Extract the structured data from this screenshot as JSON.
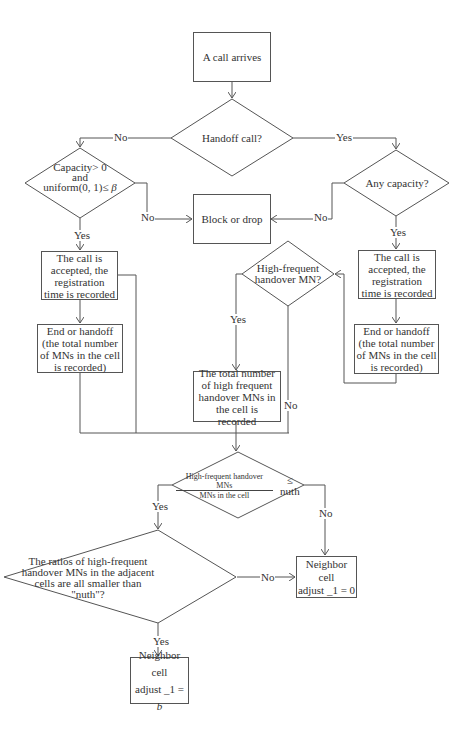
{
  "diagram": {
    "type": "flowchart",
    "nodes": {
      "start": {
        "label": "A call arrives"
      },
      "handoff_decision": {
        "label": "Handoff call?"
      },
      "new_call_decision": {
        "line1": "Capacity> 0",
        "line2": "and",
        "line3": "uniform(0, 1)≤ ",
        "beta": "β"
      },
      "any_capacity_decision": {
        "label": "Any capacity?"
      },
      "block_drop": {
        "label": "Block or drop"
      },
      "accept_left": {
        "label": "The call is accepted, the registration time is recorded"
      },
      "accept_right": {
        "label": "The call is accepted, the registration time is recorded"
      },
      "high_frequent_decision": {
        "label": "High-frequent handover MN?"
      },
      "end_left": {
        "label": "End or handoff (the total number of MNs in the cell is recorded)"
      },
      "end_right": {
        "label": "End or handoff (the total number of MNs in the cell is recorded)"
      },
      "total_number": {
        "label": "The total number of high frequent handover MNs in the cell is recorded"
      },
      "nuth_decision": {
        "numerator": "High-frequent handover MNs",
        "denominator": "MNs in the cell",
        "comparison": "≤ nuth"
      },
      "ratios_decision": {
        "label": "The ratios of high-frequent handover MNs in the adjacent cells are all smaller than \"nuth\"?"
      },
      "neighbor_zero": {
        "line1": "Neighbor cell",
        "line2": "adjust _1 = 0"
      },
      "neighbor_b": {
        "line1": "Neighbor cell",
        "line2": "adjust _1 = ",
        "var": "b"
      }
    },
    "edge_labels": {
      "handoff_no": "No",
      "handoff_yes": "Yes",
      "new_call_no": "No",
      "new_call_yes": "Yes",
      "any_capacity_no": "No",
      "any_capacity_yes": "Yes",
      "high_frequent_yes": "Yes",
      "high_frequent_no": "No",
      "nuth_yes": "Yes",
      "nuth_no": "No",
      "ratios_no": "No",
      "ratios_yes": "Yes"
    },
    "colors": {
      "line": "#555555",
      "background": "#ffffff",
      "text": "#333333"
    }
  }
}
